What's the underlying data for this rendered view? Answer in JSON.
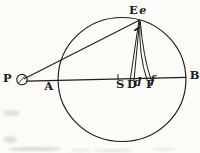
{
  "figure": {
    "ink_color": "#1c1c1c",
    "paper_color": "#fcfbf7",
    "labels": [
      {
        "id": "P",
        "text": "P",
        "style": "rm",
        "x": 3,
        "y": 72.6
      },
      {
        "id": "A",
        "text": "A",
        "style": "rm",
        "x": 44.3,
        "y": 81.0
      },
      {
        "id": "S",
        "text": "S",
        "style": "rm",
        "x": 115.9,
        "y": 78.9
      },
      {
        "id": "D",
        "text": "D",
        "style": "rm",
        "x": 126.9,
        "y": 78.9
      },
      {
        "id": "d",
        "text": "d",
        "style": "it",
        "x": 133.7,
        "y": 77.2
      },
      {
        "id": "F",
        "text": "F",
        "style": "rm",
        "x": 146.0,
        "y": 78.9
      },
      {
        "id": "f",
        "text": "f",
        "style": "it",
        "x": 150.2,
        "y": 74.6
      },
      {
        "id": "B",
        "text": "B",
        "style": "rm",
        "x": 189.8,
        "y": 70.0
      },
      {
        "id": "E",
        "text": "E",
        "style": "rm",
        "x": 128.9,
        "y": 4.6
      },
      {
        "id": "e",
        "text": "e",
        "style": "it",
        "x": 139.2,
        "y": 5.2
      }
    ]
  }
}
